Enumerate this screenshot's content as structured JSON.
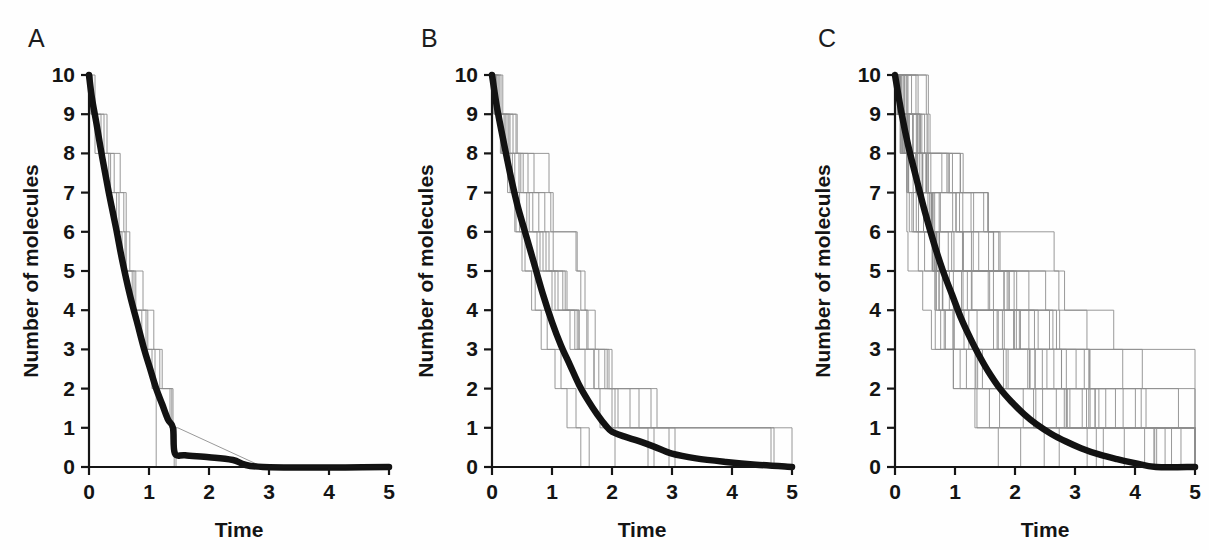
{
  "figure": {
    "background": "#fefefe",
    "trajectory_color": "#8d8d8d",
    "mean_color": "#121212",
    "axis_color": "#151515"
  },
  "panels": [
    {
      "letter": "A",
      "xlabel": "Time",
      "ylabel": "Number of molecules"
    },
    {
      "letter": "B",
      "xlabel": "Time",
      "ylabel": "Number of molecules"
    },
    {
      "letter": "C",
      "xlabel": "Time",
      "ylabel": "Number of molecules"
    }
  ],
  "axis": {
    "xticks": [
      "0",
      "1",
      "2",
      "3",
      "4",
      "5"
    ],
    "yticks": [
      "0",
      "1",
      "2",
      "3",
      "4",
      "5",
      "6",
      "7",
      "8",
      "9",
      "10"
    ]
  },
  "chart_data": [
    {
      "type": "line",
      "title": "A",
      "xlabel": "Time",
      "ylabel": "Number of molecules",
      "xlim": [
        0,
        5
      ],
      "ylim": [
        0,
        10
      ],
      "xticks": [
        0,
        1,
        2,
        3,
        4,
        5
      ],
      "yticks": [
        0,
        1,
        2,
        3,
        4,
        5,
        6,
        7,
        8,
        9,
        10
      ],
      "grid": false,
      "legend": "none",
      "n_runs": 4,
      "description": "Four stochastic decay realizations (thin grey staircases) from 10 molecules, with the thick black ensemble-average curve overlaid.",
      "mean": {
        "name": "mean",
        "x": [
          0.0,
          0.05,
          0.12,
          0.22,
          0.33,
          0.45,
          0.55,
          0.68,
          0.8,
          0.92,
          1.02,
          1.12,
          1.22,
          1.32,
          1.4,
          1.43,
          1.6,
          2.0,
          2.4,
          2.9,
          5.0
        ],
        "y": [
          10.0,
          9.4,
          8.8,
          7.9,
          7.0,
          6.1,
          5.3,
          4.4,
          3.7,
          3.0,
          2.5,
          2.0,
          1.6,
          1.2,
          1.0,
          0.35,
          0.3,
          0.25,
          0.18,
          0.0,
          0.0
        ]
      },
      "series": [
        {
          "name": "run1",
          "x": [
            0.0,
            0.06,
            0.06,
            0.3,
            0.3,
            0.42,
            0.42,
            0.5,
            0.5,
            0.6,
            0.6,
            0.78,
            0.78,
            0.95,
            0.95,
            1.05,
            1.05,
            1.12,
            1.12,
            5.0
          ],
          "y": [
            10,
            10,
            9,
            9,
            8,
            8,
            7,
            7,
            6,
            6,
            5,
            5,
            4,
            4,
            3,
            3,
            2,
            2,
            0,
            0
          ]
        },
        {
          "name": "run2",
          "x": [
            0.0,
            0.04,
            0.04,
            0.1,
            0.1,
            0.36,
            0.36,
            0.46,
            0.46,
            0.55,
            0.55,
            0.72,
            0.72,
            0.88,
            0.88,
            1.1,
            1.1,
            1.38,
            1.38,
            1.42,
            1.42,
            5.0
          ],
          "y": [
            10,
            10,
            9,
            9,
            8,
            8,
            7,
            7,
            6,
            6,
            5,
            5,
            4,
            4,
            3,
            3,
            2,
            2,
            1,
            1,
            0,
            0
          ]
        },
        {
          "name": "run3",
          "x": [
            0.0,
            0.03,
            0.03,
            0.2,
            0.2,
            0.33,
            0.33,
            0.58,
            0.58,
            0.68,
            0.68,
            0.9,
            0.9,
            1.08,
            1.08,
            1.22,
            1.22,
            1.4,
            1.4,
            1.45,
            1.45,
            5.0
          ],
          "y": [
            10,
            10,
            9,
            9,
            8,
            8,
            7,
            7,
            6,
            6,
            5,
            5,
            4,
            4,
            3,
            3,
            2,
            2,
            1,
            1,
            0,
            0
          ]
        },
        {
          "name": "run4",
          "x": [
            0.0,
            0.1,
            0.1,
            0.25,
            0.25,
            0.52,
            0.52,
            0.62,
            0.62,
            0.75,
            0.75,
            0.98,
            0.98,
            1.18,
            1.18,
            1.35,
            1.35,
            1.48,
            1.48,
            2.9,
            2.9,
            5.0
          ],
          "y": [
            10,
            10,
            9,
            9,
            8,
            8,
            7,
            7,
            5,
            5,
            4,
            4,
            3,
            3,
            2,
            2,
            1,
            1,
            1,
            0,
            0,
            0
          ]
        }
      ]
    },
    {
      "type": "line",
      "title": "B",
      "xlabel": "Time",
      "ylabel": "Number of molecules",
      "xlim": [
        0,
        5
      ],
      "ylim": [
        0,
        10
      ],
      "xticks": [
        0,
        1,
        2,
        3,
        4,
        5
      ],
      "yticks": [
        0,
        1,
        2,
        3,
        4,
        5,
        6,
        7,
        8,
        9,
        10
      ],
      "grid": false,
      "legend": "none",
      "n_runs": 10,
      "description": "Ten stochastic decay realizations from 10 molecules with thick black ensemble-average curve; averaging over more runs gives a smoother exponential decay.",
      "mean": {
        "x": [
          0.0,
          0.08,
          0.18,
          0.3,
          0.42,
          0.55,
          0.7,
          0.85,
          1.0,
          1.15,
          1.3,
          1.45,
          1.6,
          1.75,
          1.9,
          2.0,
          2.2,
          2.45,
          2.7,
          3.0,
          3.4,
          3.9,
          4.4,
          5.0
        ],
        "y": [
          10.0,
          9.2,
          8.4,
          7.5,
          6.7,
          6.0,
          5.2,
          4.4,
          3.7,
          3.1,
          2.6,
          2.1,
          1.7,
          1.35,
          1.05,
          0.9,
          0.78,
          0.66,
          0.52,
          0.34,
          0.22,
          0.13,
          0.06,
          0.0
        ]
      },
      "series": [
        {
          "name": "run1",
          "x": [
            0,
            0.05,
            0.05,
            0.22,
            0.22,
            0.34,
            0.34,
            0.4,
            0.4,
            0.55,
            0.55,
            0.72,
            0.72,
            0.92,
            0.92,
            1.15,
            1.15,
            1.4,
            1.4,
            1.62,
            1.62,
            5
          ],
          "y": [
            10,
            10,
            9,
            9,
            8,
            8,
            7,
            7,
            6,
            6,
            5,
            5,
            4,
            4,
            3,
            3,
            2,
            2,
            1,
            1,
            0,
            0
          ]
        },
        {
          "name": "run2",
          "x": [
            0,
            0.1,
            0.1,
            0.28,
            0.28,
            0.45,
            0.45,
            0.62,
            0.62,
            0.8,
            0.8,
            1.0,
            1.0,
            1.3,
            1.3,
            1.55,
            1.55,
            1.8,
            1.8,
            2.05,
            2.05,
            5
          ],
          "y": [
            10,
            10,
            9,
            9,
            8,
            8,
            7,
            7,
            6,
            6,
            5,
            5,
            4,
            4,
            3,
            3,
            2,
            2,
            1,
            1,
            0,
            0
          ]
        },
        {
          "name": "run3",
          "x": [
            0,
            0.04,
            0.04,
            0.16,
            0.16,
            0.3,
            0.3,
            0.38,
            0.38,
            0.5,
            0.5,
            0.66,
            0.66,
            0.82,
            0.82,
            1.05,
            1.05,
            1.25,
            1.25,
            1.48,
            1.48,
            5
          ],
          "y": [
            10,
            10,
            9,
            9,
            8,
            8,
            7,
            7,
            6,
            6,
            5,
            5,
            4,
            4,
            3,
            3,
            2,
            2,
            1,
            1,
            0,
            0
          ]
        },
        {
          "name": "run4",
          "x": [
            0,
            0.12,
            0.12,
            0.35,
            0.35,
            0.52,
            0.52,
            0.78,
            0.78,
            0.95,
            0.95,
            1.22,
            1.22,
            1.45,
            1.45,
            1.7,
            1.7,
            2.1,
            2.1,
            2.6,
            2.6,
            5
          ],
          "y": [
            10,
            10,
            9,
            9,
            8,
            8,
            7,
            7,
            6,
            6,
            5,
            5,
            4,
            4,
            3,
            3,
            2,
            2,
            1,
            1,
            0,
            0
          ]
        },
        {
          "name": "run5",
          "x": [
            0,
            0.08,
            0.08,
            0.25,
            0.25,
            0.6,
            0.6,
            0.88,
            0.88,
            1.02,
            1.02,
            1.18,
            1.18,
            1.42,
            1.42,
            1.7,
            1.7,
            2.0,
            2.0,
            2.95,
            2.95,
            5
          ],
          "y": [
            10,
            10,
            9,
            9,
            8,
            8,
            7,
            7,
            6,
            6,
            5,
            5,
            4,
            4,
            3,
            3,
            2,
            2,
            1,
            1,
            0,
            0
          ]
        },
        {
          "name": "run6",
          "x": [
            0,
            0.06,
            0.06,
            0.4,
            0.4,
            0.7,
            0.7,
            0.98,
            0.98,
            1.4,
            1.4,
            1.55,
            1.55,
            1.72,
            1.72,
            1.92,
            1.92,
            2.3,
            2.3,
            2.7,
            2.7,
            5
          ],
          "y": [
            10,
            10,
            9,
            9,
            8,
            8,
            7,
            7,
            6,
            6,
            5,
            5,
            4,
            4,
            3,
            3,
            2,
            2,
            1,
            1,
            0,
            0
          ]
        },
        {
          "name": "run7",
          "x": [
            0,
            0.15,
            0.15,
            0.42,
            0.42,
            0.95,
            0.95,
            1.02,
            1.02,
            1.42,
            1.42,
            1.48,
            1.48,
            1.58,
            1.58,
            1.95,
            1.95,
            2.05,
            2.05,
            4.7,
            4.7,
            5
          ],
          "y": [
            10,
            10,
            9,
            9,
            8,
            8,
            7,
            7,
            6,
            6,
            5,
            5,
            4,
            4,
            3,
            3,
            2,
            2,
            1,
            1,
            0,
            0
          ]
        },
        {
          "name": "run8",
          "x": [
            0,
            0.18,
            0.18,
            0.3,
            0.3,
            0.48,
            0.48,
            0.68,
            0.68,
            0.9,
            0.9,
            1.25,
            1.25,
            1.45,
            1.45,
            1.78,
            1.78,
            2.65,
            2.65,
            3.05,
            3.05,
            5
          ],
          "y": [
            10,
            10,
            9,
            9,
            8,
            8,
            7,
            7,
            6,
            6,
            5,
            5,
            4,
            4,
            3,
            3,
            2,
            2,
            1,
            1,
            0,
            0
          ]
        },
        {
          "name": "run9",
          "x": [
            0,
            0.07,
            0.07,
            0.2,
            0.2,
            0.38,
            0.38,
            0.58,
            0.58,
            0.85,
            0.85,
            1.1,
            1.1,
            1.38,
            1.38,
            1.88,
            1.88,
            2.75,
            2.75,
            4.65,
            4.65,
            5
          ],
          "y": [
            10,
            10,
            9,
            9,
            8,
            8,
            7,
            7,
            6,
            6,
            5,
            5,
            4,
            4,
            3,
            3,
            2,
            2,
            1,
            1,
            0,
            0
          ]
        },
        {
          "name": "run10",
          "x": [
            0,
            0.03,
            0.03,
            0.14,
            0.14,
            0.26,
            0.26,
            0.46,
            0.46,
            0.75,
            0.75,
            1.05,
            1.05,
            1.6,
            1.6,
            2.0,
            2.0,
            2.45,
            2.45,
            5.0,
            5.0,
            5
          ],
          "y": [
            10,
            10,
            9,
            9,
            8,
            8,
            7,
            7,
            6,
            6,
            5,
            5,
            4,
            4,
            3,
            3,
            2,
            2,
            1,
            1,
            0,
            0
          ]
        }
      ]
    },
    {
      "type": "line",
      "title": "C",
      "xlabel": "Time",
      "ylabel": "Number of molecules",
      "xlim": [
        0,
        5
      ],
      "ylim": [
        0,
        10
      ],
      "xticks": [
        0,
        1,
        2,
        3,
        4,
        5
      ],
      "yticks": [
        0,
        1,
        2,
        3,
        4,
        5,
        6,
        7,
        8,
        9,
        10
      ],
      "grid": false,
      "legend": "none",
      "n_runs": 30,
      "description": "Thirty stochastic decay realizations from 10 molecules; the thick black ensemble average now closely follows a smooth exponential reaching zero near t = 4.35.",
      "mean": {
        "x": [
          0.0,
          0.1,
          0.22,
          0.35,
          0.5,
          0.65,
          0.8,
          0.95,
          1.1,
          1.25,
          1.4,
          1.55,
          1.75,
          1.95,
          2.15,
          2.35,
          2.6,
          2.85,
          3.1,
          3.4,
          3.7,
          4.0,
          4.35,
          5.0
        ],
        "y": [
          10.0,
          9.1,
          8.2,
          7.4,
          6.5,
          5.7,
          5.0,
          4.4,
          3.8,
          3.3,
          2.85,
          2.45,
          2.0,
          1.65,
          1.35,
          1.1,
          0.85,
          0.65,
          0.48,
          0.32,
          0.2,
          0.1,
          0.0,
          0.0
        ]
      },
      "series_note": "30 grey staircase runs, each stepping 10 -> 0 in unit decrements at random exponential waiting times; first deaths cluster near t<0.4 and last survivors persist to t~4.3."
    }
  ]
}
